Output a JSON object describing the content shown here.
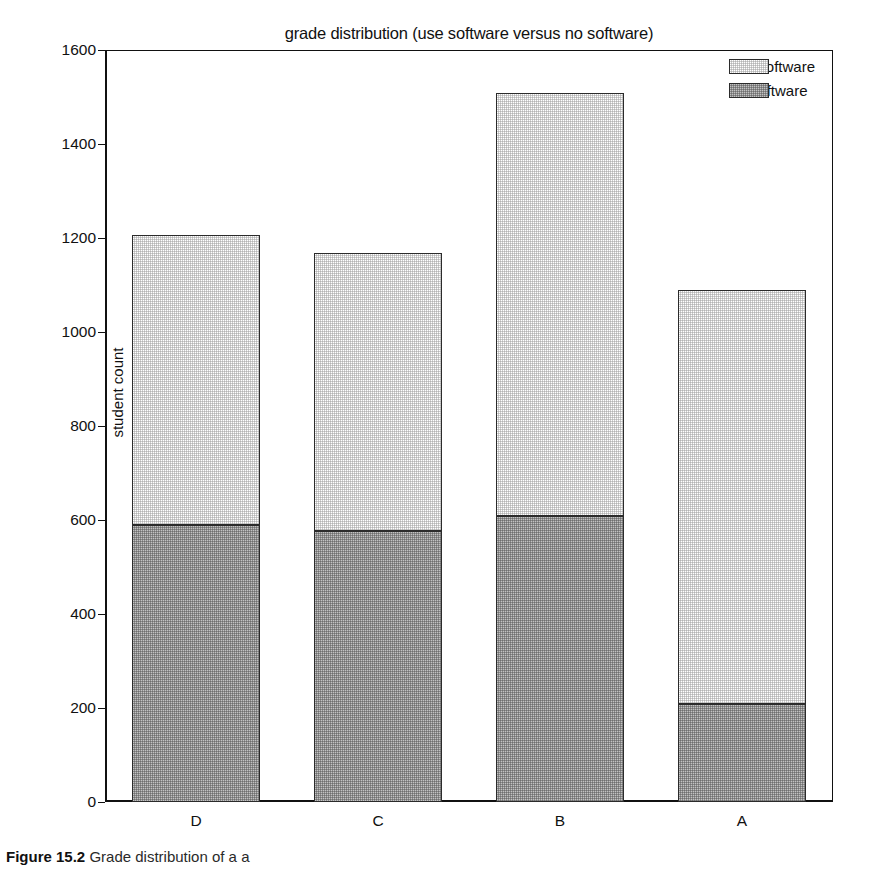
{
  "chart_data": {
    "type": "bar",
    "subtype": "stacked-vertical",
    "title": "grade distribution (use software versus no software)",
    "xlabel": "",
    "ylabel": "student count",
    "categories": [
      "D",
      "C",
      "B",
      "A"
    ],
    "series": [
      {
        "name": "no-software",
        "values": [
          590,
          576,
          608,
          208
        ],
        "color": "#8b8b8b"
      },
      {
        "name": "use-software",
        "values": [
          617,
          592,
          901,
          881
        ],
        "color": "#cdcdcd"
      }
    ],
    "stacked_totals": [
      1207,
      1168,
      1509,
      1089
    ],
    "ylim": [
      0,
      1600
    ],
    "yticks": [
      0,
      200,
      400,
      600,
      800,
      1000,
      1200,
      1400,
      1600
    ],
    "ytick_labels": [
      "0",
      "200",
      "400",
      "600",
      "800",
      "1000",
      "1200",
      "1400",
      "1600"
    ],
    "grid": false,
    "legend_position": "top-right",
    "legend_entries": [
      "use-software",
      "no-software"
    ]
  },
  "legend": {
    "items": [
      {
        "label": "use-software",
        "color": "#cdcdcd",
        "style": "light"
      },
      {
        "label": "no-software",
        "color": "#8b8b8b",
        "style": "dark"
      }
    ]
  },
  "caption": {
    "figure_number": "Figure 15.2",
    "text": "Grade distribution of a a",
    "visible_note": "partially cropped at bottom edge"
  },
  "colors": {
    "axis": "#111111",
    "bar_outline": "#2b2b2b",
    "light_fill": "#cdcdcd",
    "dark_fill": "#8b8b8b",
    "background": "#ffffff"
  }
}
